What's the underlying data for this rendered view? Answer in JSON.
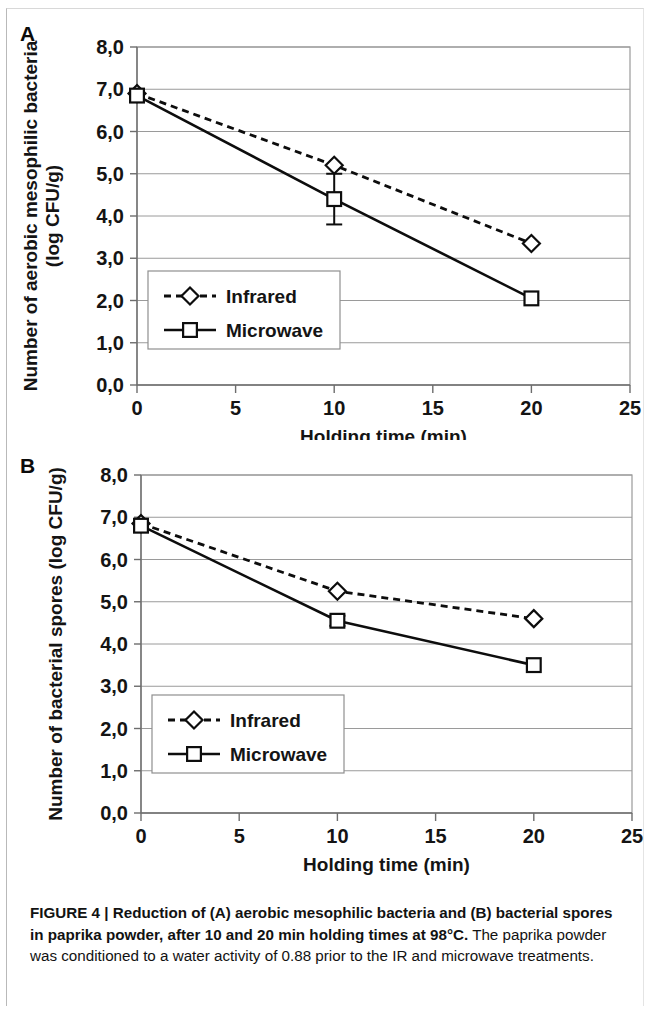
{
  "figure": {
    "panel_a_letter": "A",
    "panel_b_letter": "B",
    "caption_bold": "FIGURE 4 | Reduction of (A) aerobic mesophilic bacteria and (B) bacterial spores in paprika powder, after 10 and 20 min holding times at 98°C.",
    "caption_rest": " The paprika powder was conditioned to a water activity of 0.88 prior to the IR and microwave treatments."
  },
  "chart_data": [
    {
      "id": "panel-a",
      "type": "line",
      "title": "A",
      "xlabel": "Holding time (min)",
      "ylabel": "Number of aerobic mesophilic bacteria\n(log CFU/g)",
      "ylabel_line1": "Number of aerobic mesophilic bacteria",
      "ylabel_line2": "(log CFU/g)",
      "x": [
        0,
        10,
        20
      ],
      "xlim": [
        0,
        25
      ],
      "ylim": [
        0,
        8
      ],
      "xticks": [
        0,
        5,
        10,
        15,
        20,
        25
      ],
      "xtick_labels": [
        "0",
        "5",
        "10",
        "15",
        "20",
        "25"
      ],
      "yticks": [
        0,
        1,
        2,
        3,
        4,
        5,
        6,
        7,
        8
      ],
      "ytick_labels": [
        "0,0",
        "1,0",
        "2,0",
        "3,0",
        "4,0",
        "5,0",
        "6,0",
        "7,0",
        "8,0"
      ],
      "grid": true,
      "legend_position": "lower-left",
      "series": [
        {
          "name": "Infrared",
          "style": "dashed",
          "marker": "diamond",
          "values": [
            6.9,
            5.2,
            3.35
          ],
          "errors": [
            0.0,
            0.0,
            0.0
          ]
        },
        {
          "name": "Microwave",
          "style": "solid",
          "marker": "square",
          "values": [
            6.85,
            4.4,
            2.05
          ],
          "errors": [
            0.0,
            0.6,
            0.0
          ]
        }
      ]
    },
    {
      "id": "panel-b",
      "type": "line",
      "title": "B",
      "xlabel": "Holding time (min)",
      "ylabel": "Number of bacterial spores  (log CFU/g)",
      "ylabel_line1": "Number of bacterial spores  (log CFU/g)",
      "ylabel_line2": "",
      "x": [
        0,
        10,
        20
      ],
      "xlim": [
        0,
        25
      ],
      "ylim": [
        0,
        8
      ],
      "xticks": [
        0,
        5,
        10,
        15,
        20,
        25
      ],
      "xtick_labels": [
        "0",
        "5",
        "10",
        "15",
        "20",
        "25"
      ],
      "yticks": [
        0,
        1,
        2,
        3,
        4,
        5,
        6,
        7,
        8
      ],
      "ytick_labels": [
        "0,0",
        "1,0",
        "2,0",
        "3,0",
        "4,0",
        "5,0",
        "6,0",
        "7,0",
        "8,0"
      ],
      "grid": true,
      "legend_position": "lower-left",
      "series": [
        {
          "name": "Infrared",
          "style": "dashed",
          "marker": "diamond",
          "values": [
            6.85,
            5.25,
            4.6
          ],
          "errors": [
            0.0,
            0.0,
            0.0
          ]
        },
        {
          "name": "Microwave",
          "style": "solid",
          "marker": "square",
          "values": [
            6.8,
            4.55,
            3.5
          ],
          "errors": [
            0.0,
            0.12,
            0.0
          ]
        }
      ]
    }
  ]
}
